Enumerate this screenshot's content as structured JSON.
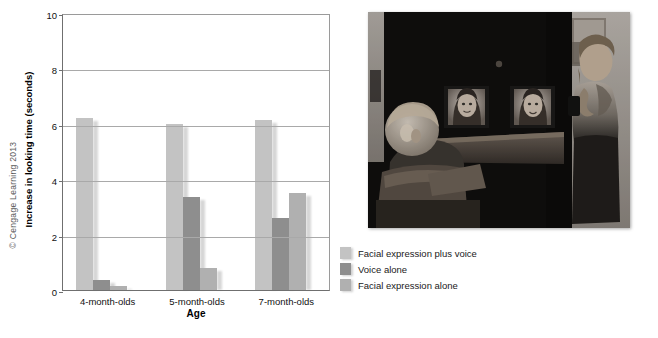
{
  "figure": {
    "copyright": "© Cengage Learning 2013",
    "photo_credit": "Photo by Mark Philbrick/Brigham Young University",
    "photo_alt": "Infant seated in a high chair in a darkened room facing two video monitors showing a woman's face, while a female researcher stands at the right side of the apparatus."
  },
  "chart_data": {
    "type": "bar",
    "title": "",
    "xlabel": "Age",
    "ylabel": "Increase in looking time (seconds)",
    "categories": [
      "4-month-olds",
      "5-month-olds",
      "7-month-olds"
    ],
    "series": [
      {
        "name": "Facial expression plus voice",
        "color": "#c3c3c3",
        "values": [
          6.2,
          6.0,
          6.15
        ]
      },
      {
        "name": "Voice alone",
        "color": "#8e8e8e",
        "values": [
          0.35,
          3.35,
          2.6
        ]
      },
      {
        "name": "Facial expression alone",
        "color": "#b0b0b0",
        "values": [
          0.15,
          0.8,
          3.5
        ]
      }
    ],
    "ylim": [
      0,
      10
    ],
    "yticks": [
      0,
      2,
      4,
      6,
      8,
      10
    ],
    "ytick_labels": [
      "0",
      "2",
      "4",
      "6",
      "8",
      "10"
    ],
    "grid": true,
    "legend_position": "right-below"
  },
  "legend": {
    "items": [
      {
        "label": "Facial expression plus voice",
        "color": "#c3c3c3"
      },
      {
        "label": "Voice alone",
        "color": "#8e8e8e"
      },
      {
        "label": "Facial expression alone",
        "color": "#b0b0b0"
      }
    ]
  }
}
